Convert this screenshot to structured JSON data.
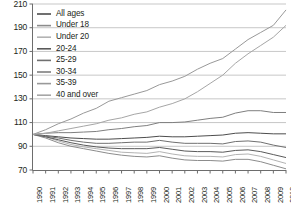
{
  "chart_data": {
    "type": "line",
    "title": "",
    "subtitle": "",
    "xlabel": "",
    "ylabel": "",
    "xlim": [
      1990,
      2010
    ],
    "ylim": [
      70,
      210
    ],
    "ytick_values": [
      210,
      190,
      170,
      150,
      130,
      110,
      90,
      70
    ],
    "ytick_labels": [
      "210",
      "190",
      "170",
      "150",
      "130",
      "110",
      "90",
      "70"
    ],
    "grid": "horizontal",
    "legend_position": "top-left",
    "x": [
      1990,
      1991,
      1992,
      1993,
      1994,
      1995,
      1996,
      1997,
      1998,
      1999,
      2000,
      2001,
      2002,
      2003,
      2004,
      2005,
      2006,
      2007,
      2008,
      2009,
      2010
    ],
    "xtick_labels": [
      "1990",
      "1991",
      "1992",
      "1993",
      "1994",
      "1995",
      "1996",
      "1997",
      "1998",
      "1999",
      "2000",
      "2001",
      "2002",
      "2003",
      "2004",
      "2005",
      "2006",
      "2007",
      "2008",
      "2009",
      "2010"
    ],
    "series": [
      {
        "name": "All ages",
        "color": "#4d4d4d",
        "values": [
          100,
          99,
          98,
          97,
          96.5,
          96,
          96,
          96.5,
          97,
          97.5,
          98.5,
          98,
          98,
          98.5,
          99,
          99.5,
          101,
          101.5,
          101,
          100.5,
          100.5
        ]
      },
      {
        "name": "Under 18",
        "color": "#8c8c8c",
        "values": [
          100,
          97,
          93,
          90,
          88,
          86,
          84,
          82.5,
          81.5,
          81,
          82,
          80,
          78.5,
          78,
          78,
          77.5,
          79,
          79,
          77,
          74,
          71
        ]
      },
      {
        "name": "Under 20",
        "color": "#b3b3b3",
        "values": [
          100,
          98,
          94.5,
          91.5,
          89.5,
          88,
          86.5,
          85,
          84.5,
          84,
          85.5,
          83.5,
          82,
          81.5,
          81.5,
          81,
          83,
          83.5,
          81.5,
          78.5,
          75.5
        ]
      },
      {
        "name": "20-24",
        "color": "#5a5a5a",
        "values": [
          100,
          98,
          95.5,
          93,
          91,
          89.5,
          88.5,
          88,
          88,
          88,
          89,
          87.5,
          86,
          85.5,
          85.5,
          85,
          86.5,
          87,
          85.5,
          83,
          80.5
        ]
      },
      {
        "name": "25-29",
        "color": "#707070",
        "values": [
          100,
          98.5,
          97,
          95,
          93.5,
          92.5,
          92.5,
          93,
          93.5,
          93.5,
          95,
          93.5,
          92.5,
          92.5,
          92.5,
          92,
          94,
          94.5,
          93.5,
          91,
          89
        ]
      },
      {
        "name": "30-34",
        "color": "#7f7f7f",
        "values": [
          100,
          101,
          101.5,
          101.5,
          102,
          102.5,
          104,
          105,
          106.5,
          107.5,
          110,
          110,
          110.5,
          112,
          113.5,
          114.5,
          118,
          120,
          120,
          118.5,
          118.5
        ]
      },
      {
        "name": "35-39",
        "color": "#999999",
        "values": [
          100,
          104,
          109,
          113,
          118,
          122,
          128,
          131,
          134,
          137,
          142,
          145,
          149,
          155,
          160,
          164,
          172,
          180,
          186,
          192,
          205
        ]
      },
      {
        "name": "40 and over",
        "color": "#a6a6a6",
        "values": [
          100,
          101,
          103,
          105,
          107,
          109,
          112,
          114,
          117,
          119,
          123,
          126,
          130,
          136,
          143,
          150,
          160,
          168,
          175,
          182,
          192
        ]
      }
    ],
    "legend_entries": [
      {
        "label": "All ages",
        "color": "#4d4d4d"
      },
      {
        "label": "Under 18",
        "color": "#8c8c8c"
      },
      {
        "label": "Under 20",
        "color": "#b3b3b3"
      },
      {
        "label": "20-24",
        "color": "#5a5a5a"
      },
      {
        "label": "25-29",
        "color": "#707070"
      },
      {
        "label": "30-34",
        "color": "#7f7f7f"
      },
      {
        "label": "35-39",
        "color": "#999999"
      },
      {
        "label": "40 and over",
        "color": "#a6a6a6"
      }
    ]
  }
}
